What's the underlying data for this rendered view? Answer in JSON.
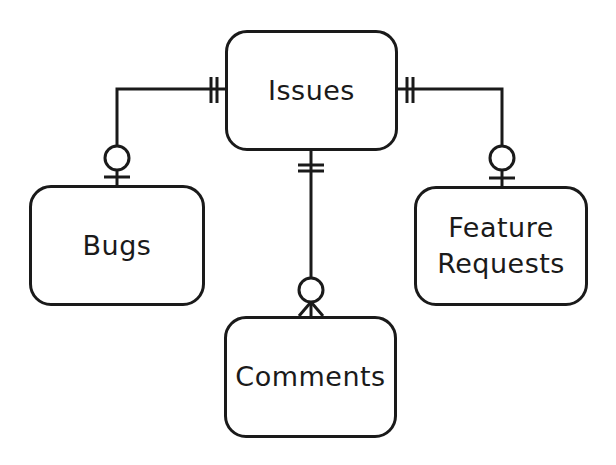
{
  "diagram": {
    "type": "entity-relationship",
    "notation": "crows-foot",
    "entities": [
      {
        "id": "issues",
        "label": "Issues"
      },
      {
        "id": "bugs",
        "label": "Bugs"
      },
      {
        "id": "features",
        "label_line1": "Feature",
        "label_line2": "Requests"
      },
      {
        "id": "comments",
        "label": "Comments"
      }
    ],
    "relationships": [
      {
        "from": "issues",
        "to": "bugs",
        "from_cardinality": "exactly-one",
        "to_cardinality": "zero-or-one"
      },
      {
        "from": "issues",
        "to": "features",
        "from_cardinality": "exactly-one",
        "to_cardinality": "zero-or-one"
      },
      {
        "from": "issues",
        "to": "comments",
        "from_cardinality": "exactly-one",
        "to_cardinality": "zero-or-many"
      }
    ],
    "colors": {
      "stroke": "#1a1a1a",
      "background": "#ffffff"
    }
  }
}
